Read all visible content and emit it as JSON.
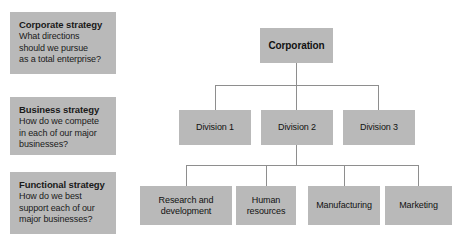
{
  "chart_data": {
    "type": "diagram",
    "panels": [
      {
        "id": "corporate",
        "title": "Corporate strategy",
        "body": "What directions should we pursue as a total enterprise?"
      },
      {
        "id": "business",
        "title": "Business strategy",
        "body": "How do we compete in each of our major businesses?"
      },
      {
        "id": "functional",
        "title": "Functional strategy",
        "body": "How do we best support each of our major businesses?"
      }
    ],
    "nodes": [
      {
        "id": "corporation",
        "label": "Corporation",
        "level": 1
      },
      {
        "id": "division-1",
        "label": "Division 1",
        "level": 2
      },
      {
        "id": "division-2",
        "label": "Division 2",
        "level": 2
      },
      {
        "id": "division-3",
        "label": "Division 3",
        "level": 2
      },
      {
        "id": "rd",
        "label": "Research and development",
        "level": 3
      },
      {
        "id": "hr",
        "label": "Human resources",
        "level": 3
      },
      {
        "id": "mfg",
        "label": "Manufacturing",
        "level": 3
      },
      {
        "id": "mkt",
        "label": "Marketing",
        "level": 3
      }
    ],
    "edges": [
      {
        "from": "corporation",
        "to": "division-1"
      },
      {
        "from": "corporation",
        "to": "division-2"
      },
      {
        "from": "corporation",
        "to": "division-3"
      },
      {
        "from": "division-2",
        "to": "rd"
      },
      {
        "from": "division-2",
        "to": "hr"
      },
      {
        "from": "division-2",
        "to": "mfg"
      },
      {
        "from": "division-2",
        "to": "mkt"
      }
    ],
    "colors": {
      "background": "#ffffff",
      "box_fill": "#b9b9b9",
      "connector": "#8e8e8e",
      "text": "#111111"
    }
  },
  "panels": {
    "corporate": {
      "title": "Corporate strategy",
      "line1": "What directions",
      "line2": "should we pursue",
      "line3": "as a total enterprise?"
    },
    "business": {
      "title": "Business strategy",
      "line1": "How do we compete",
      "line2": "in each of our major",
      "line3": "businesses?"
    },
    "functional": {
      "title": "Functional strategy",
      "line1": "How do we best",
      "line2": "support each of our",
      "line3": "major businesses?"
    }
  },
  "nodes": {
    "corporation": "Corporation",
    "division_1": "Division 1",
    "division_2": "Division 2",
    "division_3": "Division 3",
    "research_development": "Research and development",
    "human_resources": "Human resources",
    "manufacturing": "Manufacturing",
    "marketing": "Marketing"
  }
}
